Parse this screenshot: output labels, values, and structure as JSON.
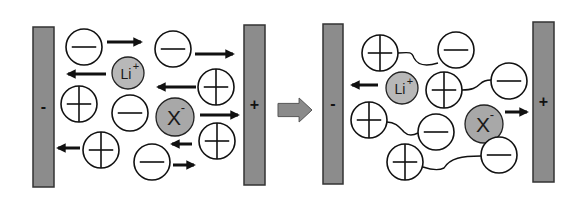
{
  "diagram": {
    "colors": {
      "electrode_fill": "#8c8c8c",
      "electrode_stroke": "#333333",
      "ion_fill": "#ffffff",
      "ion_stroke": "#111111",
      "lithium_fill": "#b8b8b8",
      "anion_fill": "#a8a8a8",
      "arrow": "#111111",
      "transition_arrow": "#8a8a8a"
    },
    "left_panel": {
      "negative_electrode": {
        "label": "-",
        "x": 33,
        "y": 27,
        "w": 21,
        "h": 160
      },
      "positive_electrode": {
        "label": "+",
        "x": 244,
        "y": 25,
        "w": 21,
        "h": 160
      },
      "ions": [
        {
          "type": "minus",
          "cx": 84,
          "cy": 47,
          "r": 18
        },
        {
          "type": "minus",
          "cx": 173,
          "cy": 49,
          "r": 18
        },
        {
          "type": "lithium",
          "label": "Li",
          "charge": "+",
          "cx": 128,
          "cy": 73,
          "r": 16
        },
        {
          "type": "plus",
          "cx": 216,
          "cy": 87,
          "r": 18
        },
        {
          "type": "plus",
          "cx": 79,
          "cy": 104,
          "r": 18
        },
        {
          "type": "minus",
          "cx": 130,
          "cy": 113,
          "r": 18
        },
        {
          "type": "anion",
          "label": "X",
          "charge": "-",
          "cx": 175,
          "cy": 117,
          "r": 19
        },
        {
          "type": "plus",
          "cx": 217,
          "cy": 141,
          "r": 18
        },
        {
          "type": "plus",
          "cx": 101,
          "cy": 150,
          "r": 18
        },
        {
          "type": "minus",
          "cx": 152,
          "cy": 162,
          "r": 18
        }
      ],
      "arrows": [
        {
          "dir": "right",
          "x1": 107,
          "x2": 141,
          "y": 42
        },
        {
          "dir": "right",
          "x1": 195,
          "x2": 233,
          "y": 54
        },
        {
          "dir": "left",
          "x1": 106,
          "x2": 68,
          "y": 74
        },
        {
          "dir": "left",
          "x1": 196,
          "x2": 158,
          "y": 87
        },
        {
          "dir": "right",
          "x1": 200,
          "x2": 238,
          "y": 115
        },
        {
          "dir": "left",
          "x1": 192,
          "x2": 172,
          "y": 144
        },
        {
          "dir": "left",
          "x1": 80,
          "x2": 58,
          "y": 148
        },
        {
          "dir": "right",
          "x1": 173,
          "x2": 194,
          "y": 165
        }
      ]
    },
    "transition_arrow": {
      "x": 278,
      "y": 98,
      "w": 34,
      "h": 24
    },
    "right_panel": {
      "negative_electrode": {
        "label": "-",
        "x": 323,
        "y": 24,
        "w": 20,
        "h": 160
      },
      "positive_electrode": {
        "label": "+",
        "x": 533,
        "y": 22,
        "w": 21,
        "h": 160
      },
      "ions": [
        {
          "type": "plus",
          "cx": 380,
          "cy": 53,
          "r": 18
        },
        {
          "type": "minus",
          "cx": 456,
          "cy": 50,
          "r": 18
        },
        {
          "type": "lithium",
          "label": "Li",
          "charge": "+",
          "cx": 402,
          "cy": 88,
          "r": 16
        },
        {
          "type": "plus",
          "cx": 444,
          "cy": 90,
          "r": 18
        },
        {
          "type": "minus",
          "cx": 509,
          "cy": 81,
          "r": 18
        },
        {
          "type": "plus",
          "cx": 369,
          "cy": 120,
          "r": 18
        },
        {
          "type": "minus",
          "cx": 436,
          "cy": 132,
          "r": 18
        },
        {
          "type": "anion",
          "label": "X",
          "charge": "-",
          "cx": 484,
          "cy": 124,
          "r": 19
        },
        {
          "type": "plus",
          "cx": 405,
          "cy": 162,
          "r": 18
        },
        {
          "type": "minus",
          "cx": 499,
          "cy": 155,
          "r": 18
        }
      ],
      "pair_links": [
        "M398,53 C410,52 412,52 414,58 C418,66 428,66 438,63",
        "M462,90 C472,90 476,88 480,84 C484,80 488,80 491,80",
        "M387,122 C396,122 400,128 404,132 C408,136 414,135 418,133",
        "M423,167 C432,170 440,170 444,168 C450,158 462,156 481,156"
      ],
      "arrows": [
        {
          "dir": "left",
          "x1": 378,
          "x2": 352,
          "y": 85
        },
        {
          "dir": "right",
          "x1": 505,
          "x2": 527,
          "y": 112
        }
      ]
    }
  }
}
